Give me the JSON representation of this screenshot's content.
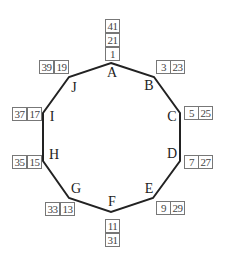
{
  "diagram": {
    "type": "decagon",
    "stroke_color": "#222222",
    "box_border_color": "#777777",
    "vertices": [
      {
        "label": "A",
        "x": 111,
        "y": 63
      },
      {
        "label": "B",
        "x": 154,
        "y": 77
      },
      {
        "label": "C",
        "x": 180,
        "y": 113
      },
      {
        "label": "D",
        "x": 180,
        "y": 161
      },
      {
        "label": "E",
        "x": 153,
        "y": 198
      },
      {
        "label": "F",
        "x": 111,
        "y": 212
      },
      {
        "label": "G",
        "x": 69,
        "y": 198
      },
      {
        "label": "H",
        "x": 43,
        "y": 161
      },
      {
        "label": "I",
        "x": 43,
        "y": 113
      },
      {
        "label": "J",
        "x": 69,
        "y": 77
      }
    ],
    "numbers": {
      "A": [
        "41",
        "21",
        "1"
      ],
      "B": [
        "3",
        "23"
      ],
      "C": [
        "5",
        "25"
      ],
      "D": [
        "7",
        "27"
      ],
      "E": [
        "9",
        "29"
      ],
      "F": [
        "11",
        "31"
      ],
      "G": [
        "33",
        "13"
      ],
      "H": [
        "35",
        "15"
      ],
      "I": [
        "37",
        "17"
      ],
      "J": [
        "39",
        "19"
      ]
    }
  }
}
